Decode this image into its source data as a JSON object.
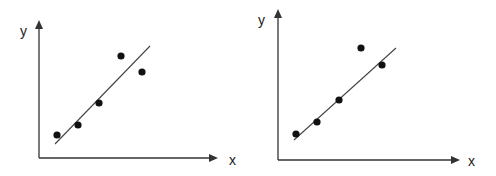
{
  "chart_data": [
    {
      "type": "scatter",
      "title": "",
      "xlabel": "x",
      "ylabel": "y",
      "grid": false,
      "legend": null,
      "ticks": "none",
      "points": [
        {
          "x": 1,
          "y": 1.0
        },
        {
          "x": 2,
          "y": 1.5
        },
        {
          "x": 3,
          "y": 2.6
        },
        {
          "x": 4,
          "y": 4.9
        },
        {
          "x": 5,
          "y": 4.1
        }
      ],
      "fit_line": {
        "type": "linear",
        "from": {
          "x": 0.9,
          "y": 0.6
        },
        "to": {
          "x": 5.4,
          "y": 5.4
        }
      },
      "render": {
        "origin": [
          39,
          158
        ],
        "x_axis_end": [
          218,
          158
        ],
        "y_axis_end": [
          39,
          20
        ],
        "xlabel_pos": [
          229,
          165
        ],
        "ylabel_pos": [
          20,
          36
        ],
        "points_px": [
          [
            57,
            135
          ],
          [
            78,
            125
          ],
          [
            99,
            103
          ],
          [
            121,
            56
          ],
          [
            142,
            72
          ]
        ],
        "line_px": [
          [
            55,
            144
          ],
          [
            150,
            46
          ]
        ]
      }
    },
    {
      "type": "scatter",
      "title": "",
      "xlabel": "x",
      "ylabel": "y",
      "grid": false,
      "legend": null,
      "ticks": "none",
      "points": [
        {
          "x": 1,
          "y": 1.1
        },
        {
          "x": 2,
          "y": 1.7
        },
        {
          "x": 3,
          "y": 2.8
        },
        {
          "x": 4,
          "y": 5.4
        },
        {
          "x": 5,
          "y": 4.6
        }
      ],
      "fit_line": {
        "type": "linear",
        "from": {
          "x": 0.9,
          "y": 0.8
        },
        "to": {
          "x": 5.7,
          "y": 5.4
        }
      },
      "render": {
        "origin": [
          278,
          160
        ],
        "x_axis_end": [
          460,
          160
        ],
        "y_axis_end": [
          278,
          9
        ],
        "xlabel_pos": [
          468,
          166
        ],
        "ylabel_pos": [
          258,
          25
        ],
        "points_px": [
          [
            296,
            134
          ],
          [
            317,
            122
          ],
          [
            339,
            100
          ],
          [
            361,
            48
          ],
          [
            382,
            65
          ]
        ],
        "line_px": [
          [
            294,
            140
          ],
          [
            396,
            48
          ]
        ]
      }
    }
  ],
  "style": {
    "axis_color": "#333333",
    "point_color": "#111111",
    "line_color": "#444444",
    "point_radius": 3.6
  }
}
